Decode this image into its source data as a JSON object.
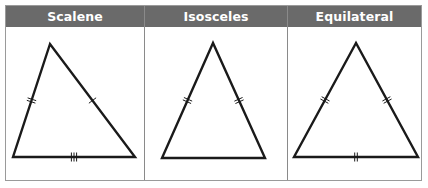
{
  "table": {
    "columns": [
      {
        "header": "Scalene",
        "triangle": {
          "vertices": [
            [
              50,
              44
            ],
            [
              13,
              157
            ],
            [
              135,
              157
            ]
          ],
          "side_marks": {
            "left": 2,
            "right": 1,
            "bottom": 3
          }
        }
      },
      {
        "header": "Isosceles",
        "triangle": {
          "vertices": [
            [
              213,
              43
            ],
            [
              162,
              158
            ],
            [
              265,
              158
            ]
          ],
          "side_marks": {
            "left": 2,
            "right": 2,
            "bottom": 0
          }
        }
      },
      {
        "header": "Equilateral",
        "triangle": {
          "vertices": [
            [
              356,
              43
            ],
            [
              294,
              157
            ],
            [
              418,
              157
            ]
          ],
          "side_marks": {
            "left": 2,
            "right": 2,
            "bottom": 2
          }
        }
      }
    ]
  },
  "colors": {
    "header_bg": "#6a6a6a",
    "header_text": "#ffffff",
    "line": "#1a1a1a",
    "border": "#8a8a8a"
  }
}
